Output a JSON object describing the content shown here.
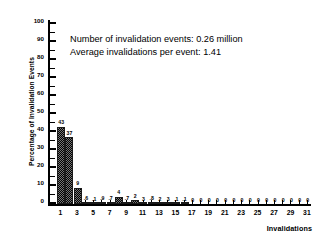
{
  "chart_data": {
    "type": "bar",
    "title": "",
    "xlabel": "Invalidations",
    "ylabel": "Percentage of Invalidation Events",
    "ylim": [
      0,
      100
    ],
    "ytick_labels": [
      "0",
      "10",
      "20",
      "30",
      "40",
      "50",
      "60",
      "70",
      "80",
      "90",
      "100"
    ],
    "ytick_values": [
      0,
      10,
      20,
      30,
      40,
      50,
      60,
      70,
      80,
      90,
      100
    ],
    "xlim": [
      0,
      32
    ],
    "xtick_labels": [
      "1",
      "3",
      "5",
      "7",
      "9",
      "11",
      "13",
      "15",
      "17",
      "19",
      "21",
      "23",
      "25",
      "27",
      "29",
      "31"
    ],
    "xtick_values": [
      1,
      3,
      5,
      7,
      9,
      11,
      13,
      15,
      17,
      19,
      21,
      23,
      25,
      27,
      29,
      31
    ],
    "grid": false,
    "legend": false,
    "categories": [
      1,
      2,
      3,
      4,
      5,
      6,
      7,
      8,
      9,
      10,
      11,
      12,
      13,
      14,
      15,
      16,
      17,
      18,
      19,
      20,
      21,
      22,
      23,
      24,
      25,
      26,
      27,
      28,
      29,
      30,
      31
    ],
    "values": [
      43,
      37,
      9,
      0.6,
      0.1,
      0.9,
      0.7,
      4,
      0.7,
      2,
      0.3,
      0.8,
      0.2,
      0.3,
      0.1,
      0.1,
      0,
      0,
      0,
      0,
      0,
      0,
      0,
      0,
      0,
      0,
      0,
      0,
      0,
      0,
      0
    ],
    "value_labels": [
      "43",
      "37",
      "9",
      ".6",
      ".1",
      ".9",
      ".7",
      "4",
      ".7",
      "2",
      "3",
      ".8",
      "2",
      "3",
      ".1",
      ".1",
      "0",
      "0",
      "0",
      "0",
      "0",
      "0",
      "0",
      "0",
      "0",
      "0",
      "0",
      "0",
      "0",
      "0",
      "0"
    ]
  },
  "annotation": {
    "line1": "Number of invalidation events:  0.26 million",
    "line2": "Average invalidations per event:  1.41"
  },
  "axis_titles": {
    "x": "Invalidations",
    "y": "Percentage of Invalidation Events"
  },
  "colors": {
    "bar_fill": "#757575",
    "bar_edge": "#1a1a1a",
    "axis": "#000000",
    "background": "#ffffff",
    "text": "#000000"
  }
}
